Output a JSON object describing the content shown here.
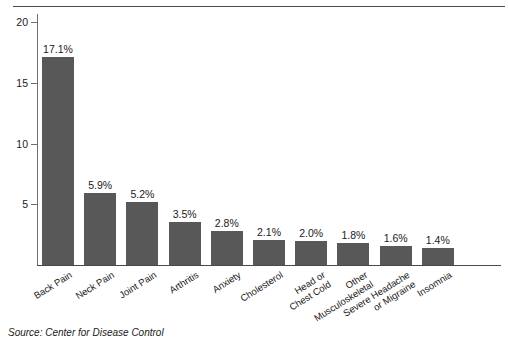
{
  "source_note": "Source: Center for Disease Control",
  "chart_data": {
    "type": "bar",
    "title": "",
    "subtitle": "",
    "xlabel": "",
    "ylabel": "",
    "grid": false,
    "legend": null,
    "orientation": "vertical",
    "bar_color": "#585858",
    "axis_color": "#4a4a4a",
    "ylim": [
      0,
      20
    ],
    "yticks": [
      5,
      10,
      15,
      20
    ],
    "ytick_labels": [
      "5",
      "10",
      "15",
      "20"
    ],
    "categories": [
      "Back Pain",
      "Neck Pain",
      "Joint Pain",
      "Arthritis",
      "Anxiety",
      "Cholesterol",
      "Head or\nChest Cold",
      "Other\nMusculoskeletal",
      "Severe Headache\nor Migraine",
      "Insomnia"
    ],
    "values": [
      17.1,
      5.9,
      5.2,
      3.5,
      2.8,
      2.1,
      2.0,
      1.8,
      1.6,
      1.4
    ],
    "data_labels": [
      "17.1%",
      "5.9%",
      "5.2%",
      "3.5%",
      "2.8%",
      "2.1%",
      "2.0%",
      "1.8%",
      "1.6%",
      "1.4%"
    ]
  }
}
